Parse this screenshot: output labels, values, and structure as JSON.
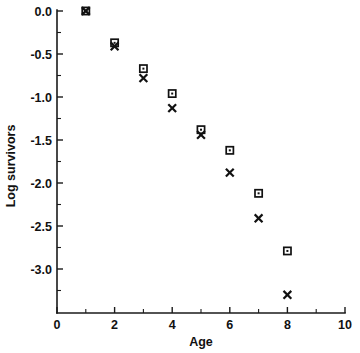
{
  "chart_data": {
    "type": "scatter",
    "title": "",
    "xlabel": "Age",
    "ylabel": "Log survivors",
    "xlim": [
      0,
      10
    ],
    "ylim": [
      -3.45,
      0.08
    ],
    "grid": false,
    "legend": "none",
    "x_ticks": [
      0,
      2,
      4,
      6,
      8,
      10
    ],
    "x_tick_labels": [
      "0",
      "2",
      "4",
      "6",
      "8",
      "10"
    ],
    "x_minor_ticks": [
      1,
      3,
      5,
      7,
      9
    ],
    "y_ticks": [
      0.0,
      -0.5,
      -1.0,
      -1.5,
      -2.0,
      -2.5,
      -3.0
    ],
    "y_tick_labels": [
      "0.0",
      "-0.5",
      "-1.0",
      "-1.5",
      "-2.0",
      "-2.5",
      "-3.0"
    ],
    "y_minor_ticks": [
      -0.25,
      -0.75,
      -1.25,
      -1.75,
      -2.25,
      -2.75,
      -3.25
    ],
    "x": [
      1,
      2,
      3,
      4,
      5,
      6,
      7,
      8
    ],
    "series": [
      {
        "name": "observed",
        "marker": "square",
        "color": "#111111",
        "values": [
          0.0,
          -0.37,
          -0.67,
          -0.96,
          -1.38,
          -1.62,
          -2.12,
          -2.79
        ]
      },
      {
        "name": "fitted",
        "marker": "x",
        "color": "#111111",
        "values": [
          0.0,
          -0.41,
          -0.78,
          -1.13,
          -1.44,
          -1.88,
          -2.41,
          -3.3
        ]
      }
    ]
  },
  "figure": {
    "background_color": "#ffffff",
    "axis_color": "#1a1a1a"
  }
}
